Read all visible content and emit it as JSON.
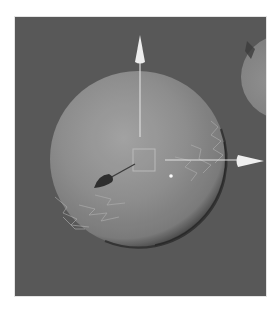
{
  "viewport": {
    "background_color": "#575757",
    "frame_color": "#e4e4e4"
  },
  "scene": {
    "main_sphere": {
      "center": [
        123,
        142
      ],
      "radius": 88,
      "highlight_color": "#a6a6a6",
      "base_color": "#8e8e8e",
      "shadow_color": "#2e2e2e"
    },
    "background_sphere": {
      "center": [
        268,
        60
      ],
      "radius": 42,
      "color": "#858585"
    },
    "gizmo": {
      "center": [
        130,
        143
      ],
      "box_size": 22,
      "y_axis_tip": [
        125,
        20
      ],
      "x_axis_tip": [
        248,
        144
      ],
      "axis_color": "#e8e8e8",
      "arrow_color": "#f4f4f4"
    },
    "light_cone": {
      "position": [
        87,
        165
      ],
      "target": [
        120,
        147
      ],
      "color": "#2a2a2a"
    },
    "pivot_dot": {
      "position": [
        156,
        159
      ],
      "color": "#ffffff"
    }
  }
}
